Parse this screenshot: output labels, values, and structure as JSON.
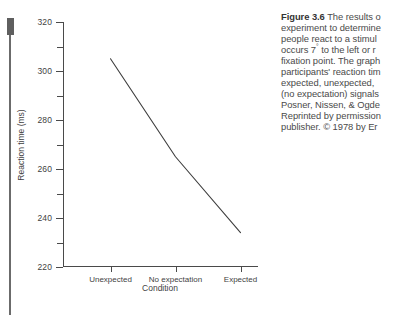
{
  "figure": {
    "caption_label": "Figure 3.6",
    "caption_lines": [
      " The results o",
      "experiment to determine",
      "people react to a stimul",
      "occurs 7° to the left or r",
      "fixation point. The graph",
      "participants' reaction tim",
      "expected, unexpected, ",
      "(no expectation) signals",
      "Posner, Nissen, & Ogde",
      "Reprinted by permission",
      "publisher. © 1978 by Er"
    ]
  },
  "chart_data": {
    "type": "line",
    "title": "",
    "xlabel": "Condition",
    "ylabel": "Reaction time (ms)",
    "categories": [
      "Unexpected",
      "No expectation",
      "Expected"
    ],
    "values": [
      305,
      265,
      234
    ],
    "ylim": [
      220,
      320
    ],
    "y_major_ticks": [
      220,
      240,
      260,
      280,
      300,
      320
    ],
    "y_minor_ticks": [
      230,
      250,
      270,
      290,
      310
    ],
    "y_tick_labels": [
      "220",
      "240",
      "260",
      "280",
      "300",
      "320"
    ],
    "grid": false,
    "legend": false,
    "line_color": "#3d3d3d",
    "axis_color": "#4a4a4a"
  }
}
